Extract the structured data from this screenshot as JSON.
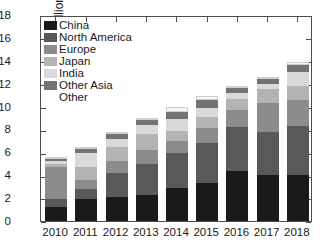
{
  "chart_data": {
    "type": "bar",
    "subtype": "stacked-vertical",
    "title": "",
    "xlabel": "",
    "ylabel": "Heat pumps (Millions)",
    "categories": [
      "2010",
      "2011",
      "2012",
      "2013",
      "2014",
      "2015",
      "2016",
      "2017",
      "2018"
    ],
    "ylim": [
      0,
      18
    ],
    "yticks": [
      0,
      2,
      4,
      6,
      8,
      10,
      12,
      14,
      16,
      18
    ],
    "grid": false,
    "legend_position": "upper-left-inside",
    "series": [
      {
        "name": "China",
        "color": "#1a1a1a",
        "values": [
          1.2,
          1.9,
          2.1,
          2.3,
          2.9,
          3.3,
          4.4,
          4.0,
          4.0
        ]
      },
      {
        "name": "North America",
        "color": "#595959",
        "values": [
          0.7,
          0.9,
          2.1,
          2.7,
          3.0,
          3.5,
          3.8,
          3.8,
          4.3
        ]
      },
      {
        "name": "Europe",
        "color": "#8c8c8c",
        "values": [
          2.8,
          0.8,
          1.0,
          1.2,
          1.1,
          1.3,
          1.5,
          2.5,
          2.3
        ]
      },
      {
        "name": "Japan",
        "color": "#b3b3b3",
        "values": [
          0.3,
          1.1,
          1.3,
          1.4,
          0.9,
          1.0,
          1.0,
          1.2,
          1.2
        ]
      },
      {
        "name": "India",
        "color": "#d9d9d9",
        "values": [
          0.2,
          1.2,
          0.7,
          0.8,
          1.0,
          0.8,
          0.5,
          0.5,
          1.2
        ]
      },
      {
        "name": "Other Asia",
        "color": "#737373",
        "values": [
          0.3,
          0.4,
          0.4,
          0.5,
          0.6,
          0.7,
          0.4,
          0.4,
          0.6
        ]
      },
      {
        "name": "Other",
        "color": "#f7f7f7",
        "values": [
          0.1,
          0.2,
          0.2,
          0.1,
          0.5,
          0.3,
          0.2,
          0.2,
          0.3
        ]
      }
    ],
    "totals": [
      5.6,
      6.5,
      7.8,
      9.0,
      10.0,
      10.9,
      11.8,
      12.6,
      13.9
    ]
  }
}
